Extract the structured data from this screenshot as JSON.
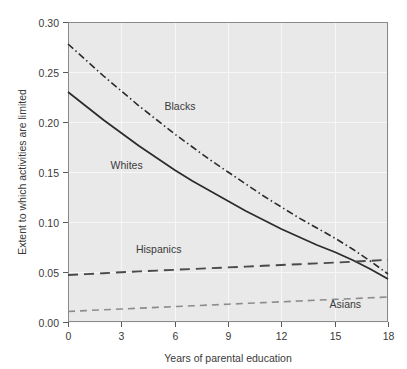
{
  "chart_data": {
    "type": "line",
    "title": "",
    "xlabel": "Years of parental education",
    "ylabel": "Extent to which activities are limited",
    "xlim": [
      0,
      18
    ],
    "ylim": [
      0.0,
      0.3
    ],
    "xticks": [
      "0",
      "3",
      "6",
      "9",
      "12",
      "15",
      "18"
    ],
    "xtick_values": [
      0,
      3,
      6,
      9,
      12,
      15,
      18
    ],
    "yticks": [
      "0.00",
      "0.05",
      "0.10",
      "0.15",
      "0.20",
      "0.25",
      "0.30"
    ],
    "ytick_values": [
      0.0,
      0.05,
      0.1,
      0.15,
      0.2,
      0.25,
      0.3
    ],
    "grid": true,
    "legend_position": "inline-annotations",
    "x": [
      0,
      1,
      2,
      3,
      4,
      5,
      6,
      7,
      8,
      9,
      10,
      11,
      12,
      13,
      14,
      15,
      16,
      17,
      18
    ],
    "series": [
      {
        "name": "Blacks",
        "label": "Blacks",
        "style": "dash-dot",
        "color": "#2b2b2b",
        "width": 1.6,
        "label_x": 6.3,
        "label_y": 0.212,
        "values": [
          0.278,
          0.262,
          0.246,
          0.231,
          0.216,
          0.202,
          0.188,
          0.175,
          0.162,
          0.15,
          0.138,
          0.126,
          0.115,
          0.104,
          0.094,
          0.084,
          0.073,
          0.061,
          0.048
        ]
      },
      {
        "name": "Whites",
        "label": "Whites",
        "style": "solid",
        "color": "#2b2b2b",
        "width": 1.7,
        "label_x": 3.3,
        "label_y": 0.153,
        "values": [
          0.23,
          0.216,
          0.202,
          0.189,
          0.176,
          0.164,
          0.152,
          0.141,
          0.131,
          0.121,
          0.111,
          0.102,
          0.093,
          0.085,
          0.077,
          0.07,
          0.062,
          0.053,
          0.043
        ]
      },
      {
        "name": "Hispanics",
        "label": "Hispanics",
        "style": "long-dash",
        "color": "#4a4a4a",
        "width": 1.9,
        "label_x": 5.1,
        "label_y": 0.069,
        "values": [
          0.047,
          0.0479,
          0.0488,
          0.0497,
          0.0506,
          0.0514,
          0.0522,
          0.053,
          0.0538,
          0.0546,
          0.0554,
          0.0562,
          0.057,
          0.0578,
          0.0586,
          0.0594,
          0.0603,
          0.0612,
          0.0622
        ]
      },
      {
        "name": "Asians",
        "label": "Asians",
        "style": "short-dash",
        "color": "#8c8c8c",
        "width": 1.6,
        "label_x": 15.6,
        "label_y": 0.014,
        "values": [
          0.0105,
          0.0114,
          0.0122,
          0.013,
          0.0138,
          0.0146,
          0.0154,
          0.0162,
          0.017,
          0.0178,
          0.0186,
          0.0194,
          0.0202,
          0.021,
          0.0218,
          0.0226,
          0.0234,
          0.0242,
          0.025
        ]
      }
    ]
  },
  "plot_geometry": {
    "left": 68,
    "right": 388,
    "top": 22,
    "bottom": 322
  }
}
